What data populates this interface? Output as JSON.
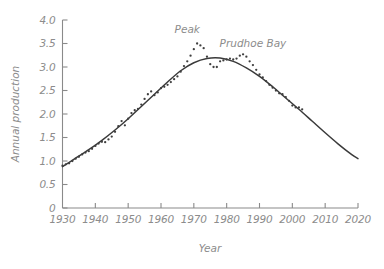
{
  "chart_data": {
    "type": "line",
    "title": "",
    "xlabel": "Year",
    "ylabel": "Annual production",
    "xlim": [
      1930,
      2020
    ],
    "ylim": [
      0,
      4.0
    ],
    "grid": false,
    "legend_position": "none",
    "x_tick_labels": [
      "1930",
      "1940",
      "1950",
      "1960",
      "1970",
      "1980",
      "1990",
      "2000",
      "2010",
      "2020"
    ],
    "x_ticks": [
      1930,
      1940,
      1950,
      1960,
      1970,
      1980,
      1990,
      2000,
      2010,
      2020
    ],
    "y_tick_labels": [
      "0",
      "0.5",
      "1.0",
      "1.5",
      "2.0",
      "2.5",
      "3.0",
      "3.5",
      "4.0"
    ],
    "y_ticks": [
      0,
      0.5,
      1.0,
      1.5,
      2.0,
      2.5,
      3.0,
      3.5,
      4.0
    ],
    "annotations": [
      {
        "text": "Peak",
        "x": 1968,
        "y": 3.72
      },
      {
        "text": "Prudhoe Bay",
        "x": 1988,
        "y": 3.42
      }
    ],
    "series": [
      {
        "name": "Fitted curve",
        "type": "line",
        "x": [
          1930,
          1934,
          1938,
          1942,
          1946,
          1950,
          1954,
          1958,
          1962,
          1966,
          1970,
          1974,
          1978,
          1982,
          1986,
          1990,
          1994,
          1998,
          2002,
          2006,
          2010,
          2014,
          2018,
          2020
        ],
        "values": [
          0.88,
          1.06,
          1.24,
          1.44,
          1.66,
          1.9,
          2.16,
          2.42,
          2.68,
          2.92,
          3.09,
          3.18,
          3.19,
          3.12,
          2.98,
          2.8,
          2.58,
          2.34,
          2.1,
          1.85,
          1.6,
          1.36,
          1.14,
          1.05
        ]
      },
      {
        "name": "Observed annual production",
        "type": "scatter",
        "x": [
          1930,
          1931,
          1932,
          1933,
          1934,
          1935,
          1936,
          1937,
          1938,
          1939,
          1940,
          1941,
          1942,
          1943,
          1944,
          1945,
          1946,
          1947,
          1948,
          1949,
          1950,
          1951,
          1952,
          1953,
          1954,
          1955,
          1956,
          1957,
          1958,
          1959,
          1960,
          1961,
          1962,
          1963,
          1964,
          1965,
          1966,
          1967,
          1968,
          1969,
          1970,
          1971,
          1972,
          1973,
          1974,
          1975,
          1976,
          1977,
          1978,
          1979,
          1980,
          1981,
          1982,
          1983,
          1984,
          1985,
          1986,
          1987,
          1988,
          1989,
          1990,
          1991,
          1992,
          1993,
          1994,
          1995,
          1996,
          1997,
          1998,
          1999,
          2000,
          2001,
          2002,
          2003
        ],
        "values": [
          0.9,
          0.93,
          0.95,
          1.0,
          1.05,
          1.09,
          1.14,
          1.18,
          1.21,
          1.26,
          1.32,
          1.37,
          1.41,
          1.4,
          1.46,
          1.52,
          1.62,
          1.74,
          1.85,
          1.76,
          1.9,
          2.02,
          2.08,
          2.11,
          2.2,
          2.32,
          2.42,
          2.48,
          2.4,
          2.46,
          2.55,
          2.58,
          2.62,
          2.68,
          2.74,
          2.8,
          2.9,
          3.02,
          3.12,
          3.24,
          3.38,
          3.5,
          3.46,
          3.4,
          3.22,
          3.06,
          3.0,
          3.0,
          3.12,
          3.14,
          3.16,
          3.18,
          3.16,
          3.18,
          3.24,
          3.27,
          3.22,
          3.12,
          3.04,
          2.94,
          2.84,
          2.78,
          2.7,
          2.62,
          2.56,
          2.5,
          2.44,
          2.42,
          2.36,
          2.28,
          2.18,
          2.14,
          2.14,
          2.1
        ]
      }
    ]
  },
  "axis_titles": {
    "x": "Year",
    "y": "Annual production"
  },
  "colors": {
    "background": "#ffffff",
    "axis": "#8a8a8a",
    "text": "#8c8c8c",
    "curve": "#3a3a3a",
    "dots": "#3f3f3f"
  }
}
